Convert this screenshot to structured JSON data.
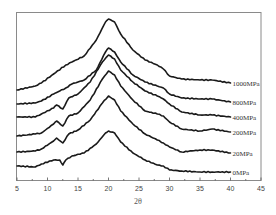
{
  "chart_data": {
    "type": "line",
    "title": "",
    "xlabel": "2θ",
    "ylabel": "",
    "xlim": [
      5,
      45
    ],
    "x_ticks": [
      5,
      10,
      15,
      20,
      25,
      30,
      35,
      40,
      45
    ],
    "grid": false,
    "legend_position": "inline-right",
    "series": [
      {
        "name": "1000MPa",
        "offset_y": 90,
        "points": [
          [
            5,
            90
          ],
          [
            8,
            86
          ],
          [
            9,
            83
          ],
          [
            11,
            74
          ],
          [
            13,
            65
          ],
          [
            14,
            62
          ],
          [
            16,
            56
          ],
          [
            18,
            40
          ],
          [
            19.5,
            22
          ],
          [
            20,
            19
          ],
          [
            21,
            22
          ],
          [
            22,
            34
          ],
          [
            24,
            50
          ],
          [
            26,
            60
          ],
          [
            28,
            65
          ],
          [
            29,
            69
          ],
          [
            30,
            76
          ],
          [
            32,
            79
          ],
          [
            35,
            80
          ],
          [
            37,
            80
          ],
          [
            40,
            83
          ]
        ]
      },
      {
        "name": "800MPa",
        "offset_y": 104,
        "points": [
          [
            5,
            104
          ],
          [
            8,
            103
          ],
          [
            9,
            101
          ],
          [
            11,
            94
          ],
          [
            13,
            88
          ],
          [
            14,
            84
          ],
          [
            16,
            80
          ],
          [
            18,
            70
          ],
          [
            19.5,
            52
          ],
          [
            20,
            48
          ],
          [
            21,
            52
          ],
          [
            22,
            62
          ],
          [
            24,
            75
          ],
          [
            26,
            82
          ],
          [
            28,
            86
          ],
          [
            29,
            88
          ],
          [
            30,
            94
          ],
          [
            32,
            98
          ],
          [
            35,
            99
          ],
          [
            37,
            99
          ],
          [
            40,
            102
          ]
        ]
      },
      {
        "name": "400MPa",
        "offset_y": 117,
        "points": [
          [
            5,
            117
          ],
          [
            8,
            117
          ],
          [
            9,
            114
          ],
          [
            11,
            108
          ],
          [
            11.5,
            105
          ],
          [
            12.5,
            109
          ],
          [
            13.5,
            98
          ],
          [
            15,
            94
          ],
          [
            17,
            82
          ],
          [
            19,
            62
          ],
          [
            20,
            55
          ],
          [
            21,
            59
          ],
          [
            22,
            70
          ],
          [
            24,
            82
          ],
          [
            26,
            91
          ],
          [
            28,
            96
          ],
          [
            29,
            99
          ],
          [
            30,
            104
          ],
          [
            32,
            112
          ],
          [
            35,
            115
          ],
          [
            37,
            115
          ],
          [
            40,
            117
          ]
        ]
      },
      {
        "name": "200MPa",
        "offset_y": 136,
        "points": [
          [
            5,
            136
          ],
          [
            8,
            134
          ],
          [
            9,
            133
          ],
          [
            11,
            124
          ],
          [
            11.5,
            121
          ],
          [
            12.5,
            126
          ],
          [
            13.5,
            116
          ],
          [
            15,
            113
          ],
          [
            17,
            100
          ],
          [
            19,
            79
          ],
          [
            20,
            71
          ],
          [
            21,
            75
          ],
          [
            22,
            86
          ],
          [
            24,
            100
          ],
          [
            26,
            111
          ],
          [
            28,
            114
          ],
          [
            29,
            116
          ],
          [
            30,
            122
          ],
          [
            32,
            129
          ],
          [
            35,
            131
          ],
          [
            37,
            129
          ],
          [
            40,
            132
          ]
        ]
      },
      {
        "name": "20MPa",
        "offset_y": 152,
        "points": [
          [
            5,
            152
          ],
          [
            8,
            151
          ],
          [
            9,
            149
          ],
          [
            11,
            141
          ],
          [
            11.5,
            138
          ],
          [
            12.5,
            143
          ],
          [
            13.5,
            134
          ],
          [
            15,
            130
          ],
          [
            17,
            120
          ],
          [
            19,
            103
          ],
          [
            20,
            96
          ],
          [
            21,
            100
          ],
          [
            22,
            111
          ],
          [
            24,
            124
          ],
          [
            26,
            134
          ],
          [
            28,
            140
          ],
          [
            29,
            143
          ],
          [
            30,
            147
          ],
          [
            32,
            152
          ],
          [
            35,
            150
          ],
          [
            37,
            150
          ],
          [
            40,
            153
          ]
        ]
      },
      {
        "name": "0MPa",
        "offset_y": 166,
        "points": [
          [
            5,
            166
          ],
          [
            8,
            167
          ],
          [
            9,
            164
          ],
          [
            11,
            160
          ],
          [
            12,
            160
          ],
          [
            12.5,
            165
          ],
          [
            13,
            160
          ],
          [
            14,
            156
          ],
          [
            16,
            153
          ],
          [
            18,
            144
          ],
          [
            19.5,
            133
          ],
          [
            20,
            131
          ],
          [
            21,
            133
          ],
          [
            22,
            142
          ],
          [
            24,
            153
          ],
          [
            26,
            160
          ],
          [
            28,
            165
          ],
          [
            29,
            166
          ],
          [
            30,
            170
          ],
          [
            32,
            171
          ],
          [
            35,
            172
          ],
          [
            37,
            172
          ],
          [
            40,
            172
          ]
        ]
      }
    ]
  },
  "labels": {
    "xlabel": "2θ",
    "ticks": [
      "5",
      "10",
      "15",
      "20",
      "25",
      "30",
      "35",
      "40",
      "45"
    ],
    "series": [
      "1000MPa",
      "800MPa",
      "400MPa",
      "200MPa",
      "20MPa",
      "0MPa"
    ]
  }
}
